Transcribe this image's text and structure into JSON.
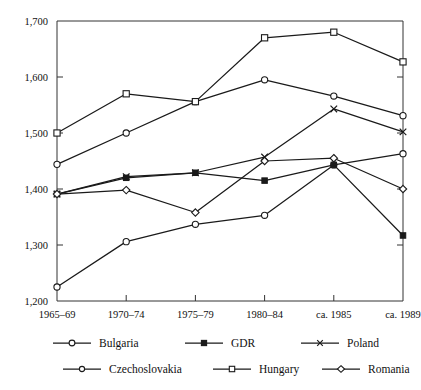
{
  "chart_data": {
    "type": "line",
    "title": "",
    "subtitle": "",
    "xlabel": "",
    "ylabel": "",
    "categories": [
      "1965–69",
      "1970–74",
      "1975–79",
      "1980–84",
      "ca. 1985",
      "ca. 1989"
    ],
    "ylim": [
      1200,
      1700
    ],
    "ytick_values": [
      1200,
      1300,
      1400,
      1500,
      1600,
      1700
    ],
    "ytick_labels": [
      "1,200",
      "1,300",
      "1,400",
      "1,500",
      "1,600",
      "1,700"
    ],
    "grid": false,
    "legend_position": "bottom",
    "legend_columns": 3,
    "series": [
      {
        "name": "Bulgaria",
        "marker": "open-circle",
        "values": [
          1225,
          1306,
          1337,
          1353,
          1443,
          1463
        ]
      },
      {
        "name": "GDR",
        "marker": "filled-square",
        "values": [
          1391,
          1420,
          1429,
          1415,
          1443,
          1317
        ]
      },
      {
        "name": "Poland",
        "marker": "x-cross",
        "values": [
          1391,
          1422,
          1429,
          1457,
          1543,
          1502
        ]
      },
      {
        "name": "Czechoslovakia",
        "marker": "open-circle",
        "values": [
          1444,
          1500,
          1556,
          1595,
          1566,
          1531
        ]
      },
      {
        "name": "Hungary",
        "marker": "open-square",
        "values": [
          1500,
          1570,
          1556,
          1670,
          1680,
          1627
        ]
      },
      {
        "name": "Romania",
        "marker": "open-diamond",
        "values": [
          1391,
          1398,
          1358,
          1450,
          1455,
          1400
        ]
      }
    ]
  },
  "axes": {
    "y_axis_name": "y-axis",
    "x_axis_name": "x-axis"
  }
}
